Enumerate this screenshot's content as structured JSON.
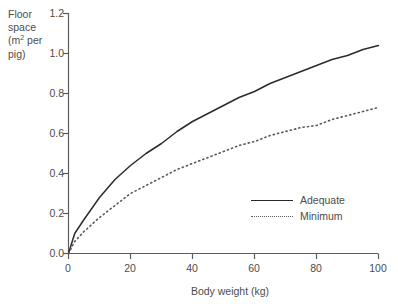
{
  "chart_data": {
    "type": "line",
    "title": "",
    "xlabel": "Body weight (kg)",
    "ylabel": "Floor space (m2 per pig)",
    "ylabel_lines": [
      "Floor",
      "space",
      "(m² per",
      "pig)"
    ],
    "xlim": [
      0,
      100
    ],
    "ylim": [
      0.0,
      1.2
    ],
    "xticks": [
      0,
      20,
      40,
      60,
      80,
      100
    ],
    "yticks": [
      0.0,
      0.2,
      0.4,
      0.6,
      0.8,
      1.0,
      1.2
    ],
    "xtick_labels": [
      "0",
      "20",
      "40",
      "60",
      "80",
      "100"
    ],
    "ytick_labels": [
      "0.0",
      "0.2",
      "0.4",
      "0.6",
      "0.8",
      "1.0",
      "1.2"
    ],
    "grid": false,
    "legend_position": "center-right",
    "x": [
      0,
      2,
      5,
      10,
      15,
      20,
      25,
      30,
      35,
      40,
      45,
      50,
      55,
      60,
      65,
      70,
      75,
      80,
      85,
      90,
      95,
      100
    ],
    "series": [
      {
        "name": "Adequate",
        "style": "solid",
        "color": "#2b2b2b",
        "values": [
          0.0,
          0.1,
          0.17,
          0.28,
          0.37,
          0.44,
          0.5,
          0.55,
          0.61,
          0.66,
          0.7,
          0.74,
          0.78,
          0.81,
          0.85,
          0.88,
          0.91,
          0.94,
          0.97,
          0.99,
          1.02,
          1.04
        ]
      },
      {
        "name": "Minimum",
        "style": "dotted",
        "color": "#5a5a5a",
        "values": [
          0.0,
          0.06,
          0.11,
          0.18,
          0.24,
          0.3,
          0.34,
          0.38,
          0.42,
          0.45,
          0.48,
          0.51,
          0.54,
          0.56,
          0.59,
          0.61,
          0.63,
          0.64,
          0.67,
          0.69,
          0.71,
          0.73
        ]
      }
    ]
  },
  "axes": {
    "y_title_line1": "Floor",
    "y_title_line2": "space",
    "y_title_line3_pre": "(m",
    "y_title_line3_sup": "2",
    "y_title_line3_post": " per",
    "y_title_line4": "pig)",
    "x_title": "Body weight (kg)"
  },
  "legend": {
    "items": [
      {
        "label": "Adequate",
        "style": "solid"
      },
      {
        "label": "Minimum",
        "style": "dotted"
      }
    ]
  },
  "colors": {
    "background": "#ffffff",
    "axis": "#5c5c5c",
    "text": "#4d4d4d",
    "series_adequate": "#2b2b2b",
    "series_minimum": "#5a5a5a"
  }
}
